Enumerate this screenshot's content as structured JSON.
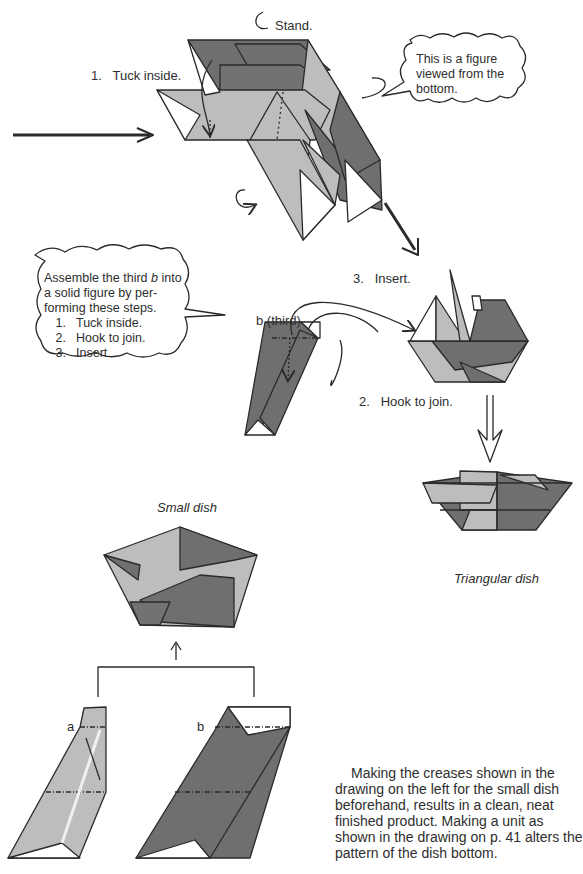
{
  "colors": {
    "dark_paper": "#6f6f6f",
    "light_paper": "#bdbdbd",
    "line": "#2a2a2a",
    "text": "#2e2e2e"
  },
  "top_figure": {
    "label_stand": "Stand.",
    "label_step1": "1.   Tuck inside.",
    "bubble_text": [
      "This is a figure",
      "viewed from the",
      "bottom."
    ]
  },
  "assembly_bubble": {
    "intro_lines": [
      "Assemble the third ",
      "b",
      " into",
      "a solid figure by per-",
      "forming these steps."
    ],
    "steps": [
      {
        "num": "1.",
        "text": "Tuck inside."
      },
      {
        "num": "2.",
        "text": "Hook to join."
      },
      {
        "num": "3.",
        "text": "Insert."
      }
    ]
  },
  "middle_figure": {
    "label_unit": "b (third)",
    "label_insert": "3.   Insert.",
    "label_hook": "2.   Hook to join."
  },
  "triangular_dish": {
    "caption": "Triangular dish"
  },
  "small_dish": {
    "caption": "Small dish",
    "unit_a_label": "a",
    "unit_b_label": "b"
  },
  "note_paragraph": "Making the creases shown in the drawing on the left for the small dish beforehand, results in a clean, neat finished product. Making a unit as shown in the drawing on p. 41 alters the pattern of the dish bottom."
}
